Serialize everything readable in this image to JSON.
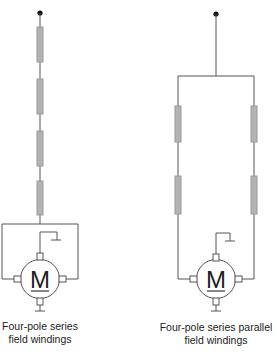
{
  "colors": {
    "wire": "#555555",
    "coil": "#b3b3b3",
    "coil_border": "#9a9a9a",
    "text": "#222222",
    "terminal_dot": "#111111"
  },
  "diagrams": [
    {
      "id": "series",
      "motor_label": "M",
      "caption_line1": "Four-pole series",
      "caption_line2": "field windings",
      "coil_count": 4
    },
    {
      "id": "series-parallel",
      "motor_label": "M",
      "caption_line1": "Four-pole series parallel",
      "caption_line2": "field windings",
      "coil_count": 4
    }
  ]
}
